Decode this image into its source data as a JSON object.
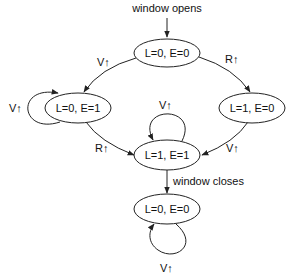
{
  "diagram": {
    "type": "state-machine",
    "nodes": [
      {
        "id": "start",
        "label": "L=0, E=0"
      },
      {
        "id": "le01",
        "label": "L=0, E=1"
      },
      {
        "id": "le10",
        "label": "L=1, E=0"
      },
      {
        "id": "le11",
        "label": "L=1, E=1"
      },
      {
        "id": "end",
        "label": "L=0, E=0"
      }
    ],
    "edges": [
      {
        "from": "entry",
        "to": "start",
        "label": "window opens"
      },
      {
        "from": "start",
        "to": "le01",
        "label": "V↑"
      },
      {
        "from": "start",
        "to": "le10",
        "label": "R↑"
      },
      {
        "from": "le01",
        "to": "le01",
        "label": "V↑"
      },
      {
        "from": "le11",
        "to": "le11",
        "label": "V↑"
      },
      {
        "from": "le01",
        "to": "le11",
        "label": "R↑"
      },
      {
        "from": "le10",
        "to": "le11",
        "label": "V↑"
      },
      {
        "from": "le11",
        "to": "end",
        "label": "window closes"
      },
      {
        "from": "end",
        "to": "end",
        "label": "V↑"
      }
    ]
  }
}
